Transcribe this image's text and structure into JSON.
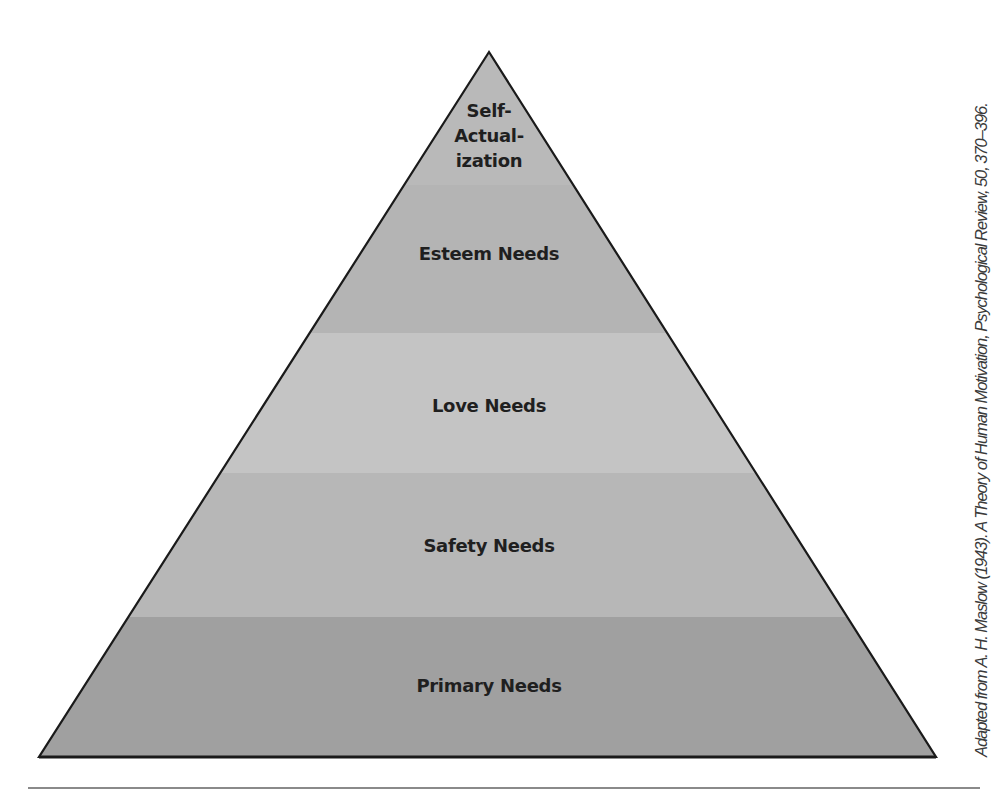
{
  "diagram": {
    "type": "pyramid",
    "outline_color": "#1a1a1a",
    "levels": [
      {
        "label_lines": [
          "Self-",
          "Actual-",
          "ization"
        ],
        "label": "Self-Actualization",
        "color": "#b9b9b9"
      },
      {
        "label": "Esteem Needs",
        "color": "#b4b4b4"
      },
      {
        "label": "Love Needs",
        "color": "#c4c4c4"
      },
      {
        "label": "Safety Needs",
        "color": "#b7b7b7"
      },
      {
        "label": "Primary Needs",
        "color": "#a0a0a0"
      }
    ]
  },
  "citation": "Adapted from A. H. Maslow (1943). A Theory of Human Motivation, Psychological Review, 50, 370–396."
}
